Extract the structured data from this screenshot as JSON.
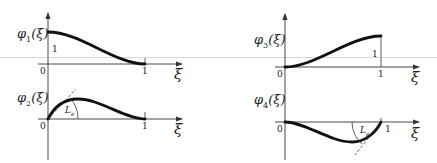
{
  "figure": {
    "panels": [
      {
        "id": "phi1",
        "function_label": "φ",
        "subscript": "1",
        "argument": "(ξ)",
        "x_axis_label": "ξ",
        "origin_label": "0",
        "x_end_label": "1",
        "value_label": "1",
        "description": "Starts at 1 at ξ=0, decreases smoothly to 0 at ξ=1 with zero slope at both ends"
      },
      {
        "id": "phi2",
        "function_label": "φ",
        "subscript": "2",
        "argument": "(ξ)",
        "x_axis_label": "ξ",
        "origin_label": "0",
        "x_end_label": "1",
        "angle_label": "L",
        "angle_subscript": "e",
        "description": "Starts at 0 with unit slope (tangent angle marked Le), rises to a peak, returns to 0 at ξ=1"
      },
      {
        "id": "phi3",
        "function_label": "φ",
        "subscript": "3",
        "argument": "(ξ)",
        "x_axis_label": "ξ",
        "origin_label": "0",
        "x_end_label": "1",
        "value_label": "1",
        "description": "Starts at 0 at ξ=0, increases smoothly to 1 at ξ=1 with zero slope at both ends"
      },
      {
        "id": "phi4",
        "function_label": "φ",
        "subscript": "4",
        "argument": "(ξ)",
        "x_axis_label": "ξ",
        "origin_label": "0",
        "x_end_label": "1",
        "angle_label": "L",
        "angle_subscript": "e",
        "description": "Starts at 0, dips below axis, returns to 0 at ξ=1 with unit slope (tangent angle marked Le)"
      }
    ]
  }
}
